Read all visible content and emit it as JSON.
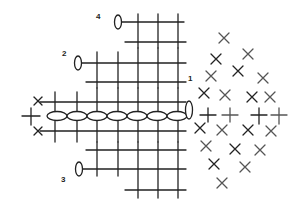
{
  "diagram": {
    "type": "crochet-stitch-chart",
    "stroke_color": "#222222",
    "fan_stroke_color": "#555555",
    "row_labels": [
      {
        "text": "4",
        "x": 96,
        "y": 13
      },
      {
        "text": "2",
        "x": 62,
        "y": 50
      },
      {
        "text": "1",
        "x": 188,
        "y": 75
      },
      {
        "text": "3",
        "x": 61,
        "y": 176
      }
    ],
    "chain": {
      "y": 116,
      "ovals_x": [
        62,
        82,
        102,
        122,
        142,
        162,
        181
      ],
      "turn_oval": {
        "x": 188,
        "y": 108
      }
    },
    "vertical_cols_x": [
      55,
      77,
      97,
      118,
      138,
      158,
      178
    ],
    "legend": {
      "oval": "chain stitch (ch)",
      "plus": "single crochet (sc)",
      "x": "single crochet in back loop"
    }
  }
}
